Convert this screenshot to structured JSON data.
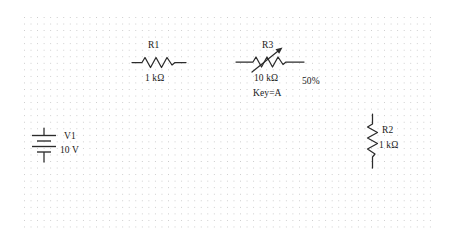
{
  "canvas": {
    "width": 454,
    "height": 248,
    "background_color": "#ffffff",
    "grid": {
      "style": "dotted",
      "dot_color": "#c9c9c9",
      "spacing_px": 6.55
    },
    "line_color": "#2b2b2b",
    "text_color": "#1a1a1a"
  },
  "circuit": {
    "title": "Voltage divider with potentiometer",
    "components": [
      {
        "id": "V1",
        "type": "battery",
        "symbol": "dc-voltage-source",
        "orientation": "vertical",
        "refdes": "V1",
        "value": "10 V",
        "cells": 2
      },
      {
        "id": "R1",
        "type": "resistor",
        "symbol": "resistor-zigzag",
        "orientation": "horizontal",
        "refdes": "R1",
        "value": "1 kΩ"
      },
      {
        "id": "R3",
        "type": "potentiometer",
        "symbol": "variable-resistor-arrow",
        "orientation": "horizontal",
        "refdes": "R3",
        "value": "10 kΩ",
        "wiper_percent": "50%",
        "key": "Key=A"
      },
      {
        "id": "R2",
        "type": "resistor",
        "symbol": "resistor-zigzag",
        "orientation": "vertical",
        "refdes": "R2",
        "value": "1 kΩ"
      }
    ]
  }
}
